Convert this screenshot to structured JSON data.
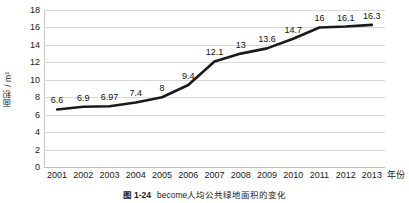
{
  "figure": {
    "caption_number": "图 1-24",
    "caption_text": "become人均公共绿地面积的变化"
  },
  "chart_data": {
    "type": "line",
    "title": "",
    "xlabel": "年份",
    "ylabel": "面积 / m²",
    "categories": [
      "2001",
      "2002",
      "2003",
      "2004",
      "2005",
      "2006",
      "2007",
      "2008",
      "2009",
      "2010",
      "2011",
      "2012",
      "2013"
    ],
    "values": [
      6.6,
      6.9,
      6.97,
      7.4,
      8,
      9.4,
      12.1,
      13,
      13.6,
      14.7,
      16,
      16.1,
      16.3
    ],
    "value_labels": [
      "6.6",
      "6.9",
      "6.97",
      "7.4",
      "8",
      "9.4",
      "12.1",
      "13",
      "13.6",
      "14.7",
      "16",
      "16.1",
      "16.3"
    ],
    "ylim": [
      0,
      18
    ],
    "yticks": [
      0,
      2,
      4,
      6,
      8,
      10,
      12,
      14,
      16,
      18
    ],
    "ytick_labels": [
      "0",
      "2",
      "4",
      "6",
      "8",
      "10",
      "12",
      "14",
      "16",
      "18"
    ],
    "grid": true,
    "legend": false,
    "series_color": "#1a1a1a",
    "grid_color": "#d9d9d9"
  }
}
